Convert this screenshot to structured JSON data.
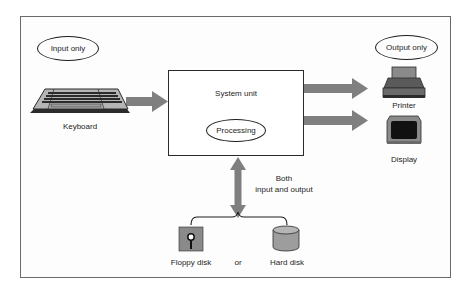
{
  "diagram": {
    "type": "computer-system-io-diagram",
    "labels": {
      "input_only": "Input only",
      "output_only": "Output only",
      "system_unit": "System unit",
      "processing": "Processing",
      "keyboard": "Keyboard",
      "printer": "Printer",
      "display": "Display",
      "both_line1": "Both",
      "both_line2": "input and output",
      "floppy_disk": "Floppy disk",
      "or": "or",
      "hard_disk": "Hard disk"
    },
    "nodes": [
      {
        "id": "keyboard",
        "label": "Keyboard",
        "category": "Input only",
        "icon": "keyboard-icon"
      },
      {
        "id": "system_unit",
        "label": "System unit",
        "contains": "Processing"
      },
      {
        "id": "printer",
        "label": "Printer",
        "category": "Output only",
        "icon": "printer-icon"
      },
      {
        "id": "display",
        "label": "Display",
        "category": "Output only",
        "icon": "monitor-icon"
      },
      {
        "id": "floppy_disk",
        "label": "Floppy disk",
        "category": "Both input and output",
        "icon": "floppy-disk-icon"
      },
      {
        "id": "hard_disk",
        "label": "Hard disk",
        "category": "Both input and output",
        "icon": "hard-disk-icon"
      }
    ],
    "edges": [
      {
        "from": "keyboard",
        "to": "system_unit",
        "direction": "one-way"
      },
      {
        "from": "system_unit",
        "to": "printer",
        "direction": "one-way"
      },
      {
        "from": "system_unit",
        "to": "display",
        "direction": "one-way"
      },
      {
        "from": "system_unit",
        "to": "storage",
        "direction": "two-way",
        "label": "Both input and output"
      }
    ],
    "colors": {
      "arrow": "#7f7f7f",
      "frame": "#6a6a6a",
      "device_dark": "#2b2b2b",
      "device_mid": "#8a8a8a",
      "device_light": "#b5b5b5"
    }
  }
}
